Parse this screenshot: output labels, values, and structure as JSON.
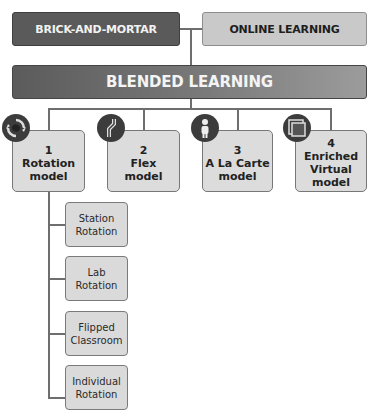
{
  "top": {
    "brick_and_mortar": "BRICK-AND-MORTAR",
    "online_learning": "ONLINE LEARNING"
  },
  "blended": {
    "label": "BLENDED LEARNING"
  },
  "models": [
    {
      "number": "1",
      "line1": "Rotation",
      "line2": "model",
      "line3": "",
      "icon": "rotation-arrows-icon"
    },
    {
      "number": "2",
      "line1": "Flex",
      "line2": "model",
      "line3": "",
      "icon": "flex-path-icon"
    },
    {
      "number": "3",
      "line1": "A La Carte",
      "line2": "model",
      "line3": "",
      "icon": "person-icon"
    },
    {
      "number": "4",
      "line1": "Enriched",
      "line2": "Virtual",
      "line3": "model",
      "icon": "overlapping-squares-icon"
    }
  ],
  "rotation_submodels": [
    {
      "line1": "Station",
      "line2": "Rotation"
    },
    {
      "line1": "Lab",
      "line2": "Rotation"
    },
    {
      "line1": "Flipped",
      "line2": "Classroom"
    },
    {
      "line1": "Individual",
      "line2": "Rotation"
    }
  ],
  "colors": {
    "dark_box": "#5a5a5a",
    "light_box": "#c9c9c9",
    "model_box": "#dcdcdc",
    "connector": "#6e6e6e",
    "icon_bg": "#3c3c3c"
  }
}
